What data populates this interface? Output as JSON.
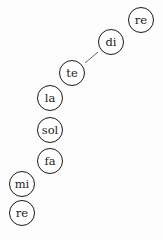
{
  "nodes": [
    {
      "label": "re",
      "x": 141,
      "y": 20
    },
    {
      "label": "di",
      "x": 111,
      "y": 42
    },
    {
      "label": "te",
      "x": 72,
      "y": 73
    },
    {
      "label": "la",
      "x": 50,
      "y": 98
    },
    {
      "label": "sol",
      "x": 50,
      "y": 130
    },
    {
      "label": "fa",
      "x": 50,
      "y": 161
    },
    {
      "label": "mi",
      "x": 22,
      "y": 184
    },
    {
      "label": "re",
      "x": 22,
      "y": 213
    }
  ],
  "edges": [
    {
      "from": 1,
      "to": 2
    }
  ]
}
